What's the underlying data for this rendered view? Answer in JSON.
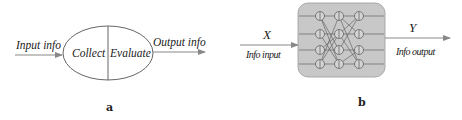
{
  "panel_a": {
    "caption": "a",
    "input_label": "Input info",
    "output_label": "Output info",
    "left_half_label": "Collect",
    "right_half_label": "Evaluate"
  },
  "panel_b": {
    "caption": "b",
    "input_symbol": "X",
    "input_label": "Info input",
    "output_symbol": "Y",
    "output_label": "Info output",
    "network": {
      "layers": 3,
      "nodes_per_layer": 4,
      "box_color": "#c8c8c8",
      "node_fill": "#d4d4d4"
    }
  },
  "colors": {
    "line": "#666666",
    "text": "#222222",
    "arrow": "#888888"
  }
}
